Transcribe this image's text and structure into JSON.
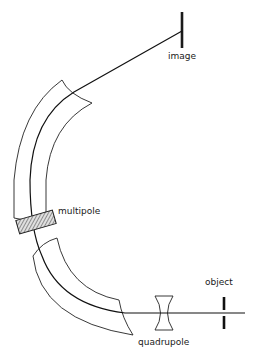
{
  "diagram": {
    "title": "",
    "labels": {
      "image": "image",
      "multipole": "multipole",
      "object": "object",
      "quadrupole": "quadrupole"
    },
    "components": [
      {
        "name": "object-slit",
        "label": "object"
      },
      {
        "name": "quadrupole-lens",
        "label": "quadrupole"
      },
      {
        "name": "lower-sector-magnet",
        "label": ""
      },
      {
        "name": "multipole-element",
        "label": "multipole"
      },
      {
        "name": "upper-sector-magnet",
        "label": ""
      },
      {
        "name": "image-slit",
        "label": "image"
      }
    ],
    "colors": {
      "line": "#1a1a1a",
      "background": "#ffffff"
    }
  }
}
